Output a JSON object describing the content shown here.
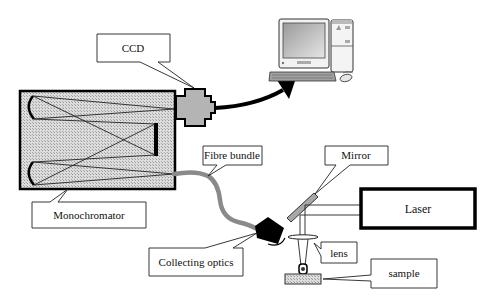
{
  "diagram": {
    "labels": {
      "ccd": "CCD",
      "monochromator": "Monochromator",
      "fibre_bundle": "Fibre bundle",
      "mirror": "Mirror",
      "laser": "Laser",
      "collecting_optics": "Collecting optics",
      "lens": "lens",
      "sample": "sample"
    },
    "components": [
      {
        "id": "monochromator",
        "shape": "hatched-rectangle"
      },
      {
        "id": "ccd",
        "shape": "cross"
      },
      {
        "id": "computer",
        "shape": "pc-icon"
      },
      {
        "id": "fibre-bundle",
        "shape": "curved-cable"
      },
      {
        "id": "collecting-optics",
        "shape": "black-cylinder"
      },
      {
        "id": "mirror",
        "shape": "diagonal-bar"
      },
      {
        "id": "laser",
        "shape": "thick-rectangle"
      },
      {
        "id": "lens",
        "shape": "ellipse"
      },
      {
        "id": "sample",
        "shape": "hatched-slab"
      }
    ],
    "connections": [
      {
        "from": "ccd",
        "to": "computer",
        "type": "arrow"
      },
      {
        "from": "monochromator",
        "to": "collecting-optics",
        "type": "fibre"
      },
      {
        "from": "laser",
        "to": "mirror",
        "type": "beam"
      },
      {
        "from": "mirror",
        "to": "lens",
        "type": "beam"
      },
      {
        "from": "lens",
        "to": "sample",
        "type": "focus"
      }
    ],
    "colors": {
      "fill_gray": "#b8b8b8",
      "hatch_gray": "#d0d0d0",
      "fibre_gray": "#8a8a8a",
      "stroke": "#000000"
    }
  }
}
